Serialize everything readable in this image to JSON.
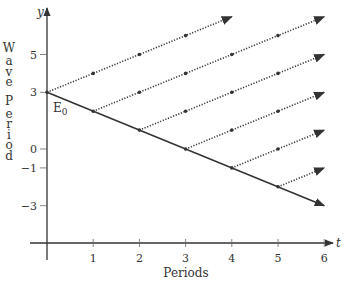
{
  "chart_data": {
    "type": "line",
    "title": "",
    "xlabel": "Periods",
    "ylabel": "Wave Period",
    "x_axis_var": "t",
    "y_axis_var": "y",
    "x_ticks": [
      1,
      2,
      3,
      4,
      5,
      6
    ],
    "x_tick_labels": [
      "1",
      "2",
      "3",
      "4",
      "5",
      "6"
    ],
    "y_ticks": [
      5,
      3,
      0,
      -1,
      -3
    ],
    "y_tick_labels": [
      "5",
      "3",
      "0",
      "−1",
      "−3"
    ],
    "xlim": [
      0,
      6
    ],
    "ylim": [
      -5,
      7.5
    ],
    "grid": false,
    "annotations": [
      {
        "text": "E",
        "subscript": "0",
        "x": 0,
        "y": 3
      }
    ],
    "series": [
      {
        "name": "main-decline",
        "style": "solid",
        "x": [
          0,
          6
        ],
        "y": [
          3,
          -3
        ],
        "markers_at": [
          0,
          1,
          2,
          3,
          4,
          5
        ]
      },
      {
        "name": "branch-0",
        "style": "dotted",
        "x": [
          0,
          4
        ],
        "y": [
          3,
          7
        ],
        "markers_at": [
          1,
          2,
          3
        ]
      },
      {
        "name": "branch-1",
        "style": "dotted",
        "x": [
          1,
          6
        ],
        "y": [
          2,
          7
        ],
        "markers_at": [
          2,
          3,
          4,
          5
        ]
      },
      {
        "name": "branch-2",
        "style": "dotted",
        "x": [
          2,
          6
        ],
        "y": [
          1,
          5
        ],
        "markers_at": [
          3,
          4,
          5
        ]
      },
      {
        "name": "branch-3",
        "style": "dotted",
        "x": [
          3,
          6
        ],
        "y": [
          0,
          3
        ],
        "markers_at": [
          4,
          5
        ]
      },
      {
        "name": "branch-4",
        "style": "dotted",
        "x": [
          4,
          6
        ],
        "y": [
          -1,
          1
        ],
        "markers_at": [
          5
        ]
      },
      {
        "name": "branch-5",
        "style": "dotted",
        "x": [
          5,
          6
        ],
        "y": [
          -2,
          -1
        ],
        "markers_at": []
      }
    ]
  },
  "labels": {
    "y_axis_letters": [
      "W",
      "a",
      "v",
      "e",
      "",
      "P",
      "e",
      "r",
      "i",
      "o",
      "d"
    ]
  }
}
